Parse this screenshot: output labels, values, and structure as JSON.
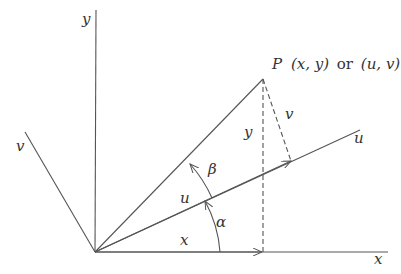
{
  "diagram": {
    "point_label": {
      "name": "P",
      "xy": "(x, y)",
      "connector": "or",
      "uv": "(u, v)"
    },
    "axes": {
      "x": "x",
      "y": "y",
      "u": "u",
      "v": "v"
    },
    "segment_labels": {
      "x_component": "x",
      "y_component": "y",
      "u_component": "u",
      "v_component": "v"
    },
    "angles": {
      "alpha": "α",
      "beta": "β"
    },
    "colors": {
      "line": "#555555",
      "text": "#333333",
      "background": "#ffffff"
    }
  }
}
